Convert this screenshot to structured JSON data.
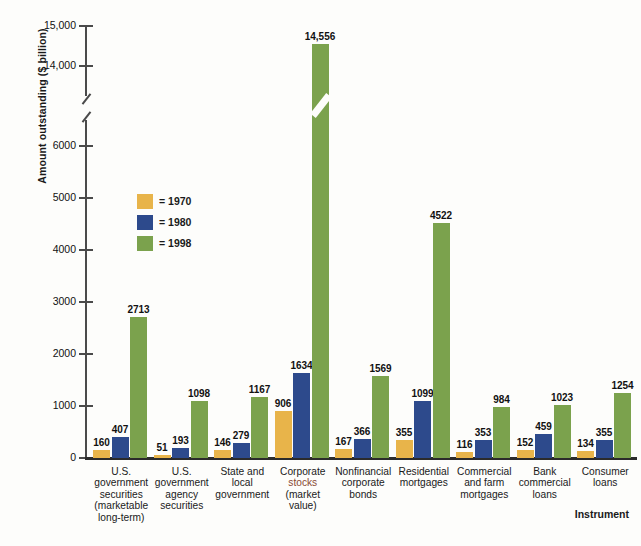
{
  "chart_data": {
    "type": "bar",
    "title": "",
    "xlabel": "Instrument",
    "ylabel": "Amount outstanding ($ billion)",
    "axis_break": true,
    "ylim": [
      0,
      15000
    ],
    "y_ticks": [
      "0",
      "1000",
      "2000",
      "3000",
      "4000",
      "5000",
      "6000",
      "14,000",
      "15,000"
    ],
    "grid": false,
    "legend_position": "inside-upper-left",
    "categories": [
      "U.S. government securities (marketable long-term)",
      "U.S. government agency securities",
      "State and local government",
      "Corporate stocks (market value)",
      "Nonfinancial corporate bonds",
      "Residential mortgages",
      "Commercial and farm mortgages",
      "Bank commercial loans",
      "Consumer loans"
    ],
    "category_lines": [
      [
        "U.S.",
        "government",
        "securities",
        "(marketable",
        "long-term)"
      ],
      [
        "U.S.",
        "government",
        "agency",
        "securities"
      ],
      [
        "State and",
        "local",
        "government"
      ],
      [
        "Corporate",
        "stocks",
        "(market",
        "value)"
      ],
      [
        "Nonfinancial",
        "corporate",
        "bonds"
      ],
      [
        "Residential",
        "mortgages"
      ],
      [
        "Commercial",
        "and farm",
        "mortgages"
      ],
      [
        "Bank",
        "commercial",
        "loans"
      ],
      [
        "Consumer",
        "loans"
      ]
    ],
    "highlight_category_word": "stocks",
    "series": [
      {
        "name": "1970",
        "color": "#e8b44a",
        "values": [
          160,
          51,
          146,
          906,
          167,
          355,
          116,
          152,
          134
        ],
        "labels": [
          "160",
          "51",
          "146",
          "906",
          "167",
          "355",
          "116",
          "152",
          "134"
        ]
      },
      {
        "name": "1980",
        "color": "#2d4a8c",
        "values": [
          407,
          193,
          279,
          1634,
          366,
          1099,
          353,
          459,
          355
        ],
        "labels": [
          "407",
          "193",
          "279",
          "1634",
          "366",
          "1099",
          "353",
          "459",
          "355"
        ]
      },
      {
        "name": "1998",
        "color": "#7ba24d",
        "values": [
          2713,
          1098,
          1167,
          14556,
          1569,
          4522,
          984,
          1023,
          1254
        ],
        "labels": [
          "2713",
          "1098",
          "1167",
          "14,556",
          "1569",
          "4522",
          "984",
          "1023",
          "1254"
        ]
      }
    ]
  },
  "legend": {
    "items": [
      {
        "marker": "=",
        "label": "1970"
      },
      {
        "marker": "=",
        "label": "1980"
      },
      {
        "marker": "=",
        "label": "1998"
      }
    ]
  },
  "colors": {
    "series_1970": "#e8b44a",
    "series_1980": "#2d4a8c",
    "series_1998": "#7ba24d",
    "axis": "#2b2b2b",
    "background": "#fdfdfb",
    "highlight_text": "#8a4a33"
  }
}
